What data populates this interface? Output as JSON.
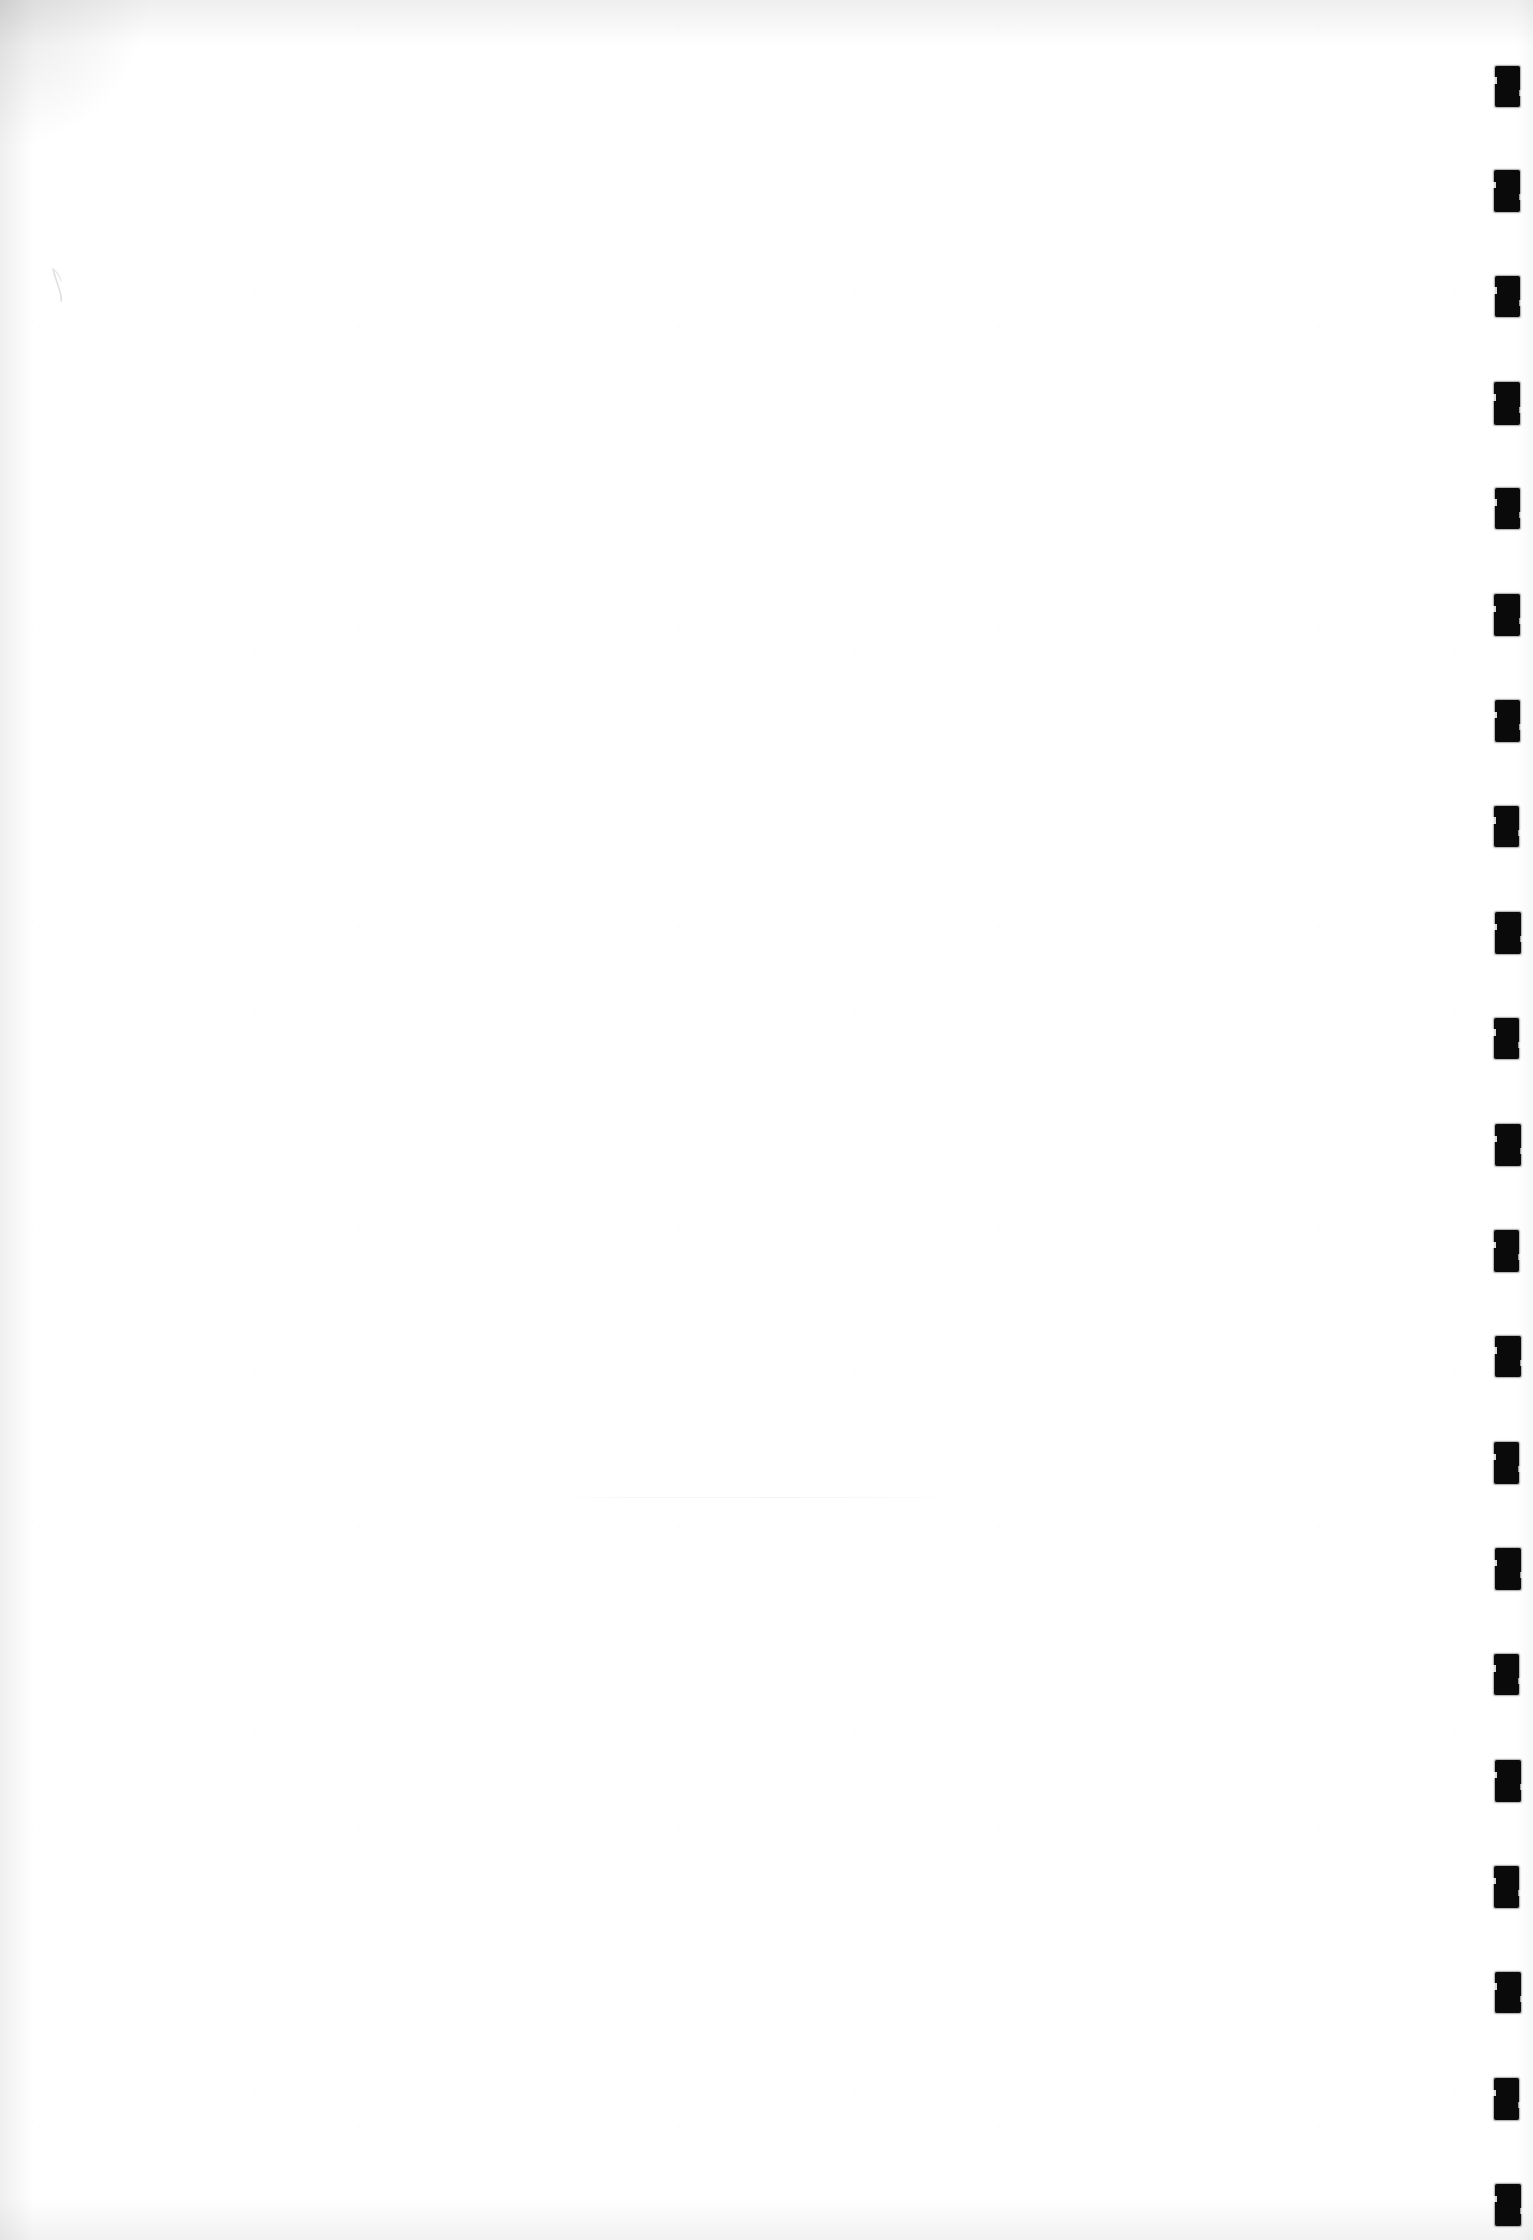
{
  "document": {
    "type": "scanned-page",
    "title": "Scanned blank page",
    "page_label": "",
    "orientation": "portrait",
    "width_px": 1533,
    "height_px": 2240,
    "body_text": "",
    "description": "Blank scanned document page with a vertical column of black register marks along the right edge"
  },
  "colors": {
    "page_background": "#ffffff",
    "mark_fill": "#0a0a0a",
    "edge_shadow": "#969696",
    "artifact_grey": "#f2f2f2"
  },
  "register_marks": {
    "name": "register-mark-column",
    "count": 21,
    "shape": "rectangle",
    "fill": "#0a0a0a",
    "left_px": 1494,
    "width_px": 25,
    "height_px": 42,
    "first_top_px": 66,
    "pitch_px": 105.6,
    "marks": [
      {
        "index": 1,
        "top": 66,
        "left": 1495,
        "width": 25,
        "height": 41
      },
      {
        "index": 2,
        "top": 170,
        "left": 1494,
        "width": 26,
        "height": 42
      },
      {
        "index": 3,
        "top": 276,
        "left": 1495,
        "width": 25,
        "height": 41
      },
      {
        "index": 4,
        "top": 382,
        "left": 1494,
        "width": 26,
        "height": 43
      },
      {
        "index": 5,
        "top": 488,
        "left": 1495,
        "width": 25,
        "height": 41
      },
      {
        "index": 6,
        "top": 594,
        "left": 1494,
        "width": 26,
        "height": 42
      },
      {
        "index": 7,
        "top": 700,
        "left": 1495,
        "width": 25,
        "height": 42
      },
      {
        "index": 8,
        "top": 806,
        "left": 1494,
        "width": 25,
        "height": 41
      },
      {
        "index": 9,
        "top": 912,
        "left": 1495,
        "width": 26,
        "height": 42
      },
      {
        "index": 10,
        "top": 1018,
        "left": 1494,
        "width": 25,
        "height": 41
      },
      {
        "index": 11,
        "top": 1124,
        "left": 1495,
        "width": 26,
        "height": 42
      },
      {
        "index": 12,
        "top": 1230,
        "left": 1494,
        "width": 25,
        "height": 42
      },
      {
        "index": 13,
        "top": 1336,
        "left": 1495,
        "width": 26,
        "height": 41
      },
      {
        "index": 14,
        "top": 1442,
        "left": 1494,
        "width": 25,
        "height": 42
      },
      {
        "index": 15,
        "top": 1548,
        "left": 1495,
        "width": 26,
        "height": 42
      },
      {
        "index": 16,
        "top": 1654,
        "left": 1494,
        "width": 25,
        "height": 41
      },
      {
        "index": 17,
        "top": 1760,
        "left": 1495,
        "width": 26,
        "height": 42
      },
      {
        "index": 18,
        "top": 1866,
        "left": 1494,
        "width": 25,
        "height": 42
      },
      {
        "index": 19,
        "top": 1972,
        "left": 1495,
        "width": 26,
        "height": 41
      },
      {
        "index": 20,
        "top": 2078,
        "left": 1494,
        "width": 25,
        "height": 42
      },
      {
        "index": 21,
        "top": 2184,
        "left": 1495,
        "width": 26,
        "height": 42
      }
    ]
  },
  "pen_stroke": {
    "name": "handwritten-pen-stroke",
    "left_px": 48,
    "top_px": 266,
    "width_px": 26,
    "height_px": 34,
    "stroke_color": "#b9b9b9",
    "note": "faint curved pen mark in upper-left margin"
  },
  "artifacts": {
    "horizontal_line": {
      "name": "scan-artifact-line",
      "left_px": 560,
      "top_px": 1497,
      "width_px": 420,
      "note": "very faint horizontal scan line near lower centre"
    },
    "edge_vignette": {
      "top": true,
      "left": true,
      "bottom": true,
      "right": true
    }
  }
}
